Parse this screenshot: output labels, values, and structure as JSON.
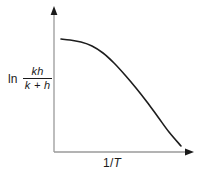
{
  "figure": {
    "background_color": "#ffffff",
    "width": 208,
    "height": 177
  },
  "axes": {
    "line_color": "#9a9a9a",
    "arrow_color": "#1a1a1a",
    "x_label": {
      "prefix": "1/",
      "variable": "T",
      "full": "1/T"
    },
    "y_label": {
      "operator": "ln",
      "numerator": "kh",
      "denominator": "k + h",
      "full": "ln kh/(k + h)"
    }
  },
  "chart_data": {
    "type": "line",
    "title": "",
    "xlabel": "1/T",
    "ylabel": "ln kh/(k + h)",
    "grid": false,
    "legend": null,
    "axis_style": "arrow",
    "xlim": [
      0,
      1
    ],
    "ylim": [
      0,
      1
    ],
    "series": [
      {
        "name": "ln kh/(k + h) vs 1/T",
        "color": "#1d1d1d",
        "line_width": 1.6,
        "description": "Plateau at low 1/T then curving down to a steep linear decrease",
        "x": [
          0.05,
          0.12,
          0.2,
          0.28,
          0.36,
          0.44,
          0.52,
          0.6,
          0.68,
          0.76,
          0.84,
          0.93
        ],
        "y": [
          0.795,
          0.79,
          0.778,
          0.752,
          0.71,
          0.652,
          0.583,
          0.507,
          0.428,
          0.345,
          0.258,
          0.165
        ],
        "points_px": [
          [
            61,
            39
          ],
          [
            70,
            40
          ],
          [
            81,
            42
          ],
          [
            92,
            46
          ],
          [
            103,
            53
          ],
          [
            114,
            63
          ],
          [
            125,
            75
          ],
          [
            136,
            88
          ],
          [
            147,
            102
          ],
          [
            158,
            117
          ],
          [
            169,
            132
          ],
          [
            181,
            146
          ]
        ]
      }
    ]
  }
}
